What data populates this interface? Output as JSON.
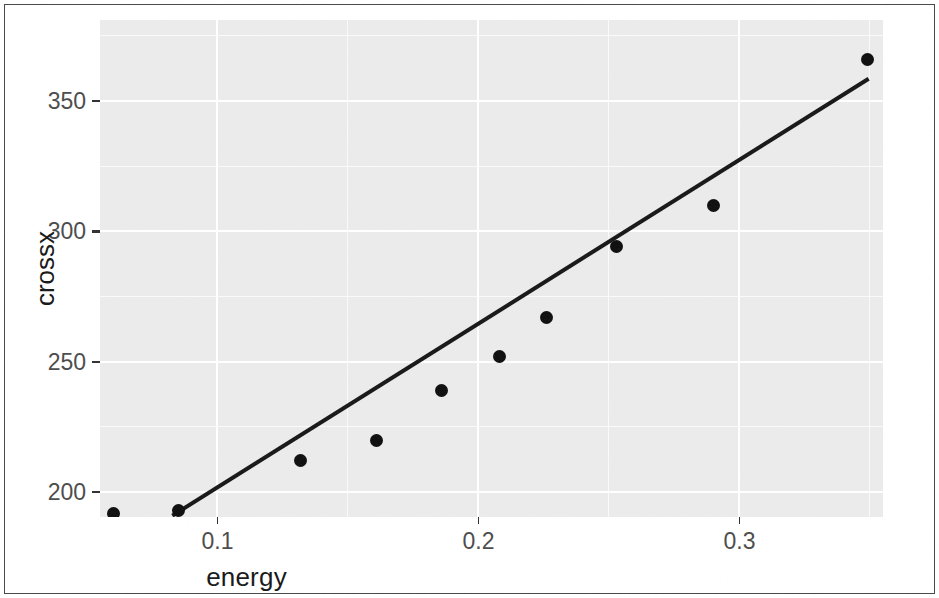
{
  "figure": {
    "background_color": "#ffffff",
    "panel_color": "#ebebeb",
    "grid_color": "#ffffff",
    "point_color": "#111111",
    "line_color": "#1a1a1a",
    "border_color": "#4a4a4a"
  },
  "axes": {
    "x_title": "energy",
    "y_title": "crossx",
    "x_ticks": [
      "0.1",
      "0.2",
      "0.3"
    ],
    "x_tick_values": [
      0.1,
      0.2,
      0.3
    ],
    "y_ticks": [
      "200",
      "250",
      "300",
      "350"
    ],
    "y_tick_values": [
      200,
      250,
      300,
      350
    ]
  },
  "chart_data": {
    "type": "scatter",
    "title": "",
    "subtitle": "",
    "xlabel": "energy",
    "ylabel": "crossx",
    "xlim": [
      0.055,
      0.355
    ],
    "ylim": [
      190.5,
      381
    ],
    "xticks": [
      0.1,
      0.2,
      0.3
    ],
    "yticks": [
      200,
      250,
      300,
      350
    ],
    "minor_xticks": [
      0.05,
      0.15,
      0.25,
      0.35
    ],
    "minor_yticks": [
      225,
      275,
      325,
      375
    ],
    "grid": true,
    "legend": null,
    "series": [
      {
        "name": "observations",
        "type": "scatter",
        "marker": "filled-circle",
        "color": "#111111",
        "points": [
          {
            "x": 0.06,
            "y": 192
          },
          {
            "x": 0.085,
            "y": 193
          },
          {
            "x": 0.132,
            "y": 212
          },
          {
            "x": 0.161,
            "y": 220
          },
          {
            "x": 0.186,
            "y": 239
          },
          {
            "x": 0.208,
            "y": 252
          },
          {
            "x": 0.226,
            "y": 267
          },
          {
            "x": 0.253,
            "y": 294
          },
          {
            "x": 0.29,
            "y": 310
          },
          {
            "x": 0.349,
            "y": 366
          }
        ]
      },
      {
        "name": "fitted-line",
        "type": "line",
        "color": "#1a1a1a",
        "points": [
          {
            "x": 0.0827,
            "y": 191.0
          },
          {
            "x": 0.3495,
            "y": 358.5
          }
        ]
      }
    ]
  }
}
